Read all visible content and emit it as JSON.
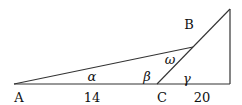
{
  "diagram": {
    "stroke_color": "#333333",
    "points": {
      "A": {
        "x": 14,
        "y": 84
      },
      "C": {
        "x": 157,
        "y": 84
      },
      "D": {
        "x": 230,
        "y": 84
      },
      "E": {
        "x": 230,
        "y": 9
      },
      "B": {
        "x": 193,
        "y": 47
      }
    },
    "labels": {
      "A": "A",
      "B": "B",
      "C": "C",
      "len_AC": "14",
      "len_CD": "20",
      "alpha": "α",
      "beta": "β",
      "gamma": "γ",
      "omega": "ω"
    }
  }
}
